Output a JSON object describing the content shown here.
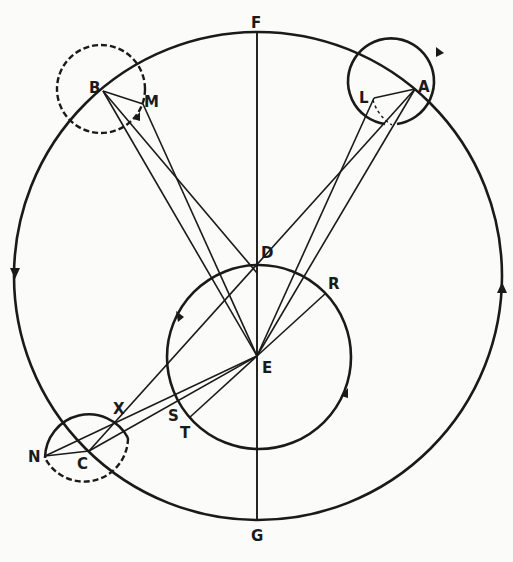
{
  "diagram": {
    "title": "",
    "labels": {
      "F": "F",
      "G": "G",
      "A": "A",
      "B": "B",
      "C": "C",
      "D": "D",
      "E": "E",
      "L": "L",
      "M": "M",
      "N": "N",
      "R": "R",
      "S": "S",
      "T": "T",
      "X": "X"
    },
    "colors": {
      "ink": "#1a1a1a",
      "background": "#fbfbfa"
    },
    "elements": {
      "outer_circle": "orbit-circle",
      "inner_circle": "inner-circle",
      "epicycles": [
        "A",
        "B",
        "C"
      ],
      "axis": "F-G"
    }
  }
}
